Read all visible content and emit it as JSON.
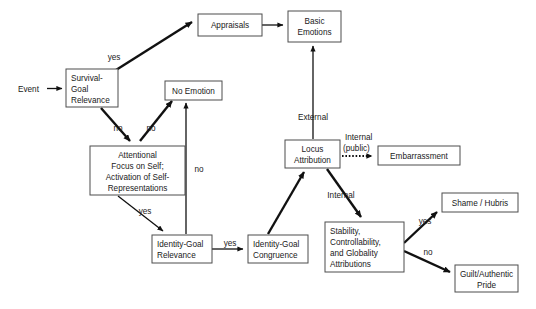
{
  "diagram": {
    "canvas": {
      "width": 536,
      "height": 309,
      "background": "#ffffff"
    },
    "colors": {
      "box_stroke": "#4d4d4d",
      "box_fill": "#ffffff",
      "link": "#111111",
      "text": "#1a1a1a"
    },
    "entry_label": "Event",
    "nodes": [
      {
        "id": "survival-goal-relevance",
        "lines": [
          "Survival-",
          "Goal",
          "Relevance"
        ],
        "align": "left",
        "x": 66,
        "y": 69,
        "w": 52,
        "h": 38
      },
      {
        "id": "appraisals",
        "lines": [
          "Appraisals"
        ],
        "align": "center",
        "x": 198,
        "y": 14,
        "w": 64,
        "h": 22
      },
      {
        "id": "basic-emotions",
        "lines": [
          "Basic",
          "Emotions"
        ],
        "align": "center",
        "x": 288,
        "y": 11,
        "w": 53,
        "h": 31
      },
      {
        "id": "no-emotion",
        "lines": [
          "No Emotion"
        ],
        "align": "center",
        "x": 165,
        "y": 81,
        "w": 57,
        "h": 19
      },
      {
        "id": "attentional-focus",
        "lines": [
          "Attentional",
          "Focus on Self;",
          "Activation of Self-",
          "Representations"
        ],
        "align": "center",
        "x": 90,
        "y": 146,
        "w": 95,
        "h": 49
      },
      {
        "id": "identity-goal-relevance",
        "lines": [
          "Identity-Goal",
          "Relevance"
        ],
        "align": "left",
        "x": 152,
        "y": 235,
        "w": 60,
        "h": 28
      },
      {
        "id": "identity-goal-congruence",
        "lines": [
          "Identity-Goal",
          "Congruence"
        ],
        "align": "left",
        "x": 248,
        "y": 235,
        "w": 60,
        "h": 28
      },
      {
        "id": "locus-attribution",
        "lines": [
          "Locus",
          "Attribution"
        ],
        "align": "center",
        "x": 285,
        "y": 140,
        "w": 55,
        "h": 28
      },
      {
        "id": "embarrassment",
        "lines": [
          "Embarrassment"
        ],
        "align": "center",
        "x": 378,
        "y": 146,
        "w": 82,
        "h": 19
      },
      {
        "id": "stability-attributions",
        "lines": [
          "Stability,",
          "Controllability,",
          "and Globality",
          "Attributions"
        ],
        "align": "left",
        "x": 325,
        "y": 222,
        "w": 79,
        "h": 50
      },
      {
        "id": "shame-hubris",
        "lines": [
          "Shame / Hubris"
        ],
        "align": "center",
        "x": 442,
        "y": 193,
        "w": 76,
        "h": 19
      },
      {
        "id": "guilt-authentic-pride",
        "lines": [
          "Guilt/Authentic",
          "Pride"
        ],
        "align": "center",
        "x": 455,
        "y": 265,
        "w": 63,
        "h": 27
      }
    ],
    "edge_labels": [
      {
        "id": "yes-survival-to-appraisals",
        "text": "yes",
        "x": 114,
        "y": 60
      },
      {
        "id": "no-survival-to-attentional",
        "text": "no",
        "x": 118,
        "y": 131
      },
      {
        "id": "no-attentional-to-no-emotion",
        "text": "no",
        "x": 151,
        "y": 131
      },
      {
        "id": "no-relevance-to-no-emotion",
        "text": "no",
        "x": 199,
        "y": 172
      },
      {
        "id": "yes-attentional-to-relevance",
        "text": "yes",
        "x": 145,
        "y": 214
      },
      {
        "id": "yes-relevance-to-congruence",
        "text": "yes",
        "x": 230,
        "y": 246
      },
      {
        "id": "external-locus-to-basic",
        "text": "External",
        "x": 313,
        "y": 120
      },
      {
        "id": "internal-public-line1",
        "text": "Internal",
        "x": 363,
        "y": 140
      },
      {
        "id": "internal-public-line2",
        "text": "(public)",
        "x": 363,
        "y": 151
      },
      {
        "id": "internal-locus-to-stability",
        "text": "Internal",
        "x": 341,
        "y": 198
      },
      {
        "id": "yes-stability-to-shame",
        "text": "yes",
        "x": 425,
        "y": 224
      },
      {
        "id": "no-stability-to-guilt",
        "text": "no",
        "x": 428,
        "y": 255
      }
    ]
  }
}
